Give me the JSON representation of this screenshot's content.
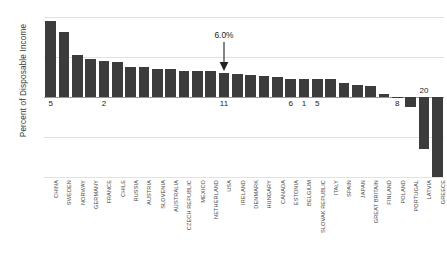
{
  "chart_data": {
    "type": "bar",
    "title": "",
    "xlabel": "",
    "ylabel": "Percent of Disposable Income",
    "ylim": [
      -20,
      20
    ],
    "yticks": [
      20,
      10,
      0,
      -10,
      -20
    ],
    "ytick_labels": [
      "20%",
      "10%",
      "0%",
      "-10%",
      "-20%"
    ],
    "grid": true,
    "legend": "none",
    "bar_color": "#3c3c3c",
    "categories": [
      "CHINA",
      "SWEDEN",
      "NORWAY",
      "GERMANY",
      "FRANCE",
      "CHILE",
      "RUSSIA",
      "AUSTRIA",
      "SLOVENIA",
      "AUSTRALIA",
      "CZECH REPUBLIC",
      "MEXICO",
      "NETHERLAND",
      "USA",
      "IRELAND",
      "DENMARK",
      "HUNGARY",
      "CANADA",
      "ESTONIA",
      "BELGIUM",
      "SLOVAK REPUBLIC",
      "ITALY",
      "SPAIN",
      "JAPAN",
      "GREAT BRITAIN",
      "FINLAND",
      "POLAND",
      "PORTUGAL",
      "LATVIA",
      "GREECE"
    ],
    "values": [
      19.0,
      16.2,
      10.5,
      9.6,
      8.9,
      8.8,
      7.6,
      7.4,
      7.0,
      7.0,
      6.6,
      6.6,
      6.5,
      6.0,
      5.7,
      5.5,
      5.2,
      5.0,
      4.6,
      4.6,
      4.4,
      4.4,
      3.4,
      3.0,
      2.8,
      0.8,
      0.1,
      -2.6,
      -13.0,
      -20.0
    ],
    "annotations": [
      {
        "text": "6.0%",
        "category": "USA",
        "value": 6.0,
        "style": "arrow-down"
      }
    ],
    "inline_labels": [
      {
        "text": "5",
        "category": "CHINA"
      },
      {
        "text": "2",
        "category": "FRANCE"
      },
      {
        "text": "11",
        "category": "USA"
      },
      {
        "text": "6",
        "category": "ESTONIA"
      },
      {
        "text": "1",
        "category": "BELGIUM"
      },
      {
        "text": "5",
        "category": "SLOVAK REPUBLIC"
      },
      {
        "text": "8",
        "category": "POLAND"
      },
      {
        "text": "20",
        "category": "LATVIA"
      }
    ]
  }
}
